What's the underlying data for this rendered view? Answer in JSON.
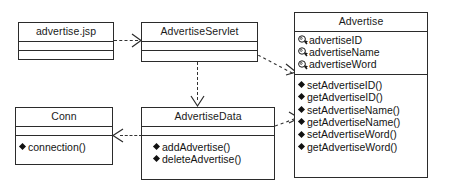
{
  "diagram": {
    "type": "uml-class-diagram",
    "background": "#ffffff",
    "line_color": "#2b2b2b"
  },
  "classes": {
    "advertise_jsp": {
      "name": "advertise.jsp",
      "attributes": [],
      "operations": []
    },
    "advertise_servlet": {
      "name": "AdvertiseServlet",
      "attributes": [],
      "operations": []
    },
    "advertise": {
      "name": "Advertise",
      "attributes": [
        {
          "label": "advertiseID",
          "icon": "private-attribute-icon"
        },
        {
          "label": "advertiseName",
          "icon": "private-attribute-icon"
        },
        {
          "label": "advertiseWord",
          "icon": "private-attribute-icon"
        }
      ],
      "operations": [
        {
          "label": "setAdvertiseID()",
          "icon": "operation-diamond-icon"
        },
        {
          "label": "getAdvertiseID()",
          "icon": "operation-diamond-icon"
        },
        {
          "label": "setAdvertiseName()",
          "icon": "operation-diamond-icon"
        },
        {
          "label": "getAdvertiseName()",
          "icon": "operation-diamond-icon"
        },
        {
          "label": "setAdvertiseWord()",
          "icon": "operation-diamond-icon"
        },
        {
          "label": "getAdvertiseWord()",
          "icon": "operation-diamond-icon"
        }
      ]
    },
    "conn": {
      "name": "Conn",
      "attributes": [],
      "operations": [
        {
          "label": "connection()",
          "icon": "operation-diamond-icon"
        }
      ]
    },
    "advertise_data": {
      "name": "AdvertiseData",
      "attributes": [],
      "operations": [
        {
          "label": "addAdvertise()",
          "icon": "operation-diamond-icon"
        },
        {
          "label": "deleteAdvertise()",
          "icon": "operation-diamond-icon"
        }
      ]
    }
  },
  "relationships": [
    {
      "id": "jsp-to-servlet",
      "from": "advertise.jsp",
      "to": "AdvertiseServlet",
      "style": "dependency",
      "label": ""
    },
    {
      "id": "servlet-to-advertise",
      "from": "AdvertiseServlet",
      "to": "Advertise",
      "style": "dependency",
      "label": ""
    },
    {
      "id": "servlet-to-data",
      "from": "AdvertiseServlet",
      "to": "AdvertiseData",
      "style": "dependency",
      "label": ""
    },
    {
      "id": "data-to-conn",
      "from": "AdvertiseData",
      "to": "Conn",
      "style": "dependency",
      "label": ""
    },
    {
      "id": "data-to-advertise",
      "from": "AdvertiseData",
      "to": "Advertise",
      "style": "dependency",
      "label": ""
    }
  ]
}
